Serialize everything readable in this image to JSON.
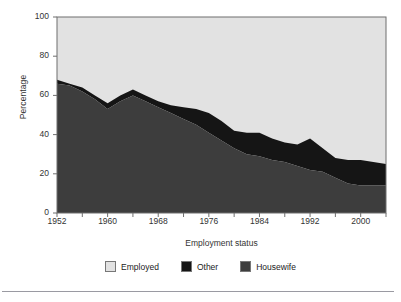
{
  "chart_data": {
    "type": "area",
    "stacked": true,
    "title": "",
    "xlabel": "Employment status",
    "ylabel": "Percentage",
    "ylim": [
      0,
      100
    ],
    "xlim": [
      1952,
      2004
    ],
    "ytick_labels": [
      "0",
      "20",
      "40",
      "60",
      "80",
      "100"
    ],
    "ytick_values": [
      0,
      20,
      40,
      60,
      80,
      100
    ],
    "xtick_labels": [
      "1952",
      "1960",
      "1968",
      "1976",
      "1984",
      "1992",
      "2000"
    ],
    "xtick_values": [
      1952,
      1960,
      1968,
      1976,
      1984,
      1992,
      2000
    ],
    "minor_xtick_values": [
      1956,
      1964,
      1972,
      1980,
      1988,
      1996,
      2004
    ],
    "grid": false,
    "legend_position": "bottom",
    "x": [
      1952,
      1954,
      1956,
      1958,
      1960,
      1962,
      1964,
      1966,
      1968,
      1970,
      1972,
      1974,
      1976,
      1978,
      1980,
      1982,
      1984,
      1986,
      1988,
      1990,
      1992,
      1994,
      1996,
      1998,
      2000,
      2002,
      2004
    ],
    "series": [
      {
        "name": "Housewife",
        "color": "#3d3d3d",
        "values": [
          66,
          65,
          62,
          58,
          53,
          57,
          60,
          57,
          54,
          51,
          48,
          45,
          41,
          37,
          33,
          30,
          29,
          27,
          26,
          24,
          22,
          21,
          18,
          15,
          14,
          14,
          14
        ]
      },
      {
        "name": "Other",
        "color": "#151515",
        "values": [
          2,
          1,
          2,
          2,
          3,
          3,
          3,
          3,
          3,
          4,
          6,
          8,
          10,
          10,
          9,
          11,
          12,
          11,
          10,
          11,
          16,
          12,
          10,
          12,
          13,
          12,
          11
        ]
      },
      {
        "name": "Employed",
        "color": "#e2e2e2",
        "values": [
          32,
          34,
          36,
          40,
          44,
          40,
          37,
          40,
          43,
          45,
          46,
          47,
          49,
          53,
          58,
          59,
          59,
          62,
          64,
          65,
          62,
          67,
          72,
          73,
          73,
          74,
          75
        ]
      }
    ],
    "series_top_boundary": {
      "housewife_plus_other": [
        68,
        66,
        64,
        60,
        56,
        60,
        63,
        60,
        57,
        55,
        54,
        53,
        51,
        47,
        42,
        41,
        41,
        38,
        36,
        35,
        38,
        33,
        28,
        27,
        27,
        26,
        25
      ]
    }
  },
  "legend": {
    "items": [
      {
        "label": "Employed",
        "color": "#e2e2e2"
      },
      {
        "label": "Other",
        "color": "#151515"
      },
      {
        "label": "Housewife",
        "color": "#3d3d3d"
      }
    ]
  },
  "axes": {
    "y_title": "Percentage",
    "x_title": "Employment status"
  }
}
